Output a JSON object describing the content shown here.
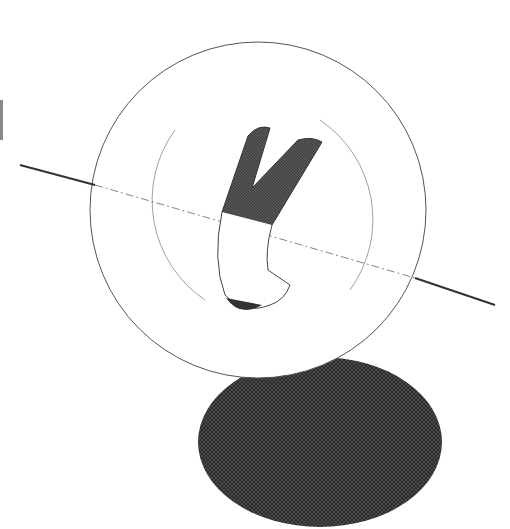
{
  "image": {
    "description": "Pen-and-ink illustration: figure upside-down inside a large circle above a crosshatched dark oval shadow, with a grassy horizon line crossing the circle",
    "colors": {
      "background": "#ffffff",
      "ink": "#333333",
      "hatch": "#3a3a3a"
    }
  }
}
